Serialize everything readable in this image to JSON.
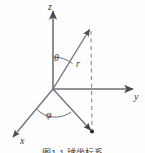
{
  "figure": {
    "caption": "图1-1  球坐标系",
    "background_color": "#fdfdfd",
    "stroke_color": "#6e6e78",
    "label_color": "#3a3a3a"
  },
  "axes": [
    {
      "id": "z",
      "label": "z",
      "direction": "up",
      "from": [
        53,
        89
      ],
      "to": [
        53,
        9
      ]
    },
    {
      "id": "y",
      "label": "y",
      "direction": "right",
      "from": [
        53,
        89
      ],
      "to": [
        136,
        89
      ]
    },
    {
      "id": "x",
      "label": "x",
      "direction": "down-left",
      "from": [
        53,
        89
      ],
      "to": [
        11,
        139
      ]
    }
  ],
  "vector": {
    "id": "r",
    "label": "r",
    "from": [
      53,
      89
    ],
    "to": [
      91,
      27
    ],
    "has_arrowhead": true
  },
  "projection": {
    "id": "xy-projection",
    "label": "",
    "from": [
      53,
      89
    ],
    "to": [
      92,
      132
    ],
    "has_arrowhead": true
  },
  "dashed_line": {
    "id": "vertical-dashed",
    "from": [
      91,
      29
    ],
    "to": [
      92,
      132
    ],
    "style": "dashed"
  },
  "angles": [
    {
      "id": "theta",
      "label": "θ",
      "between": [
        "z-axis",
        "r-vector"
      ],
      "vertex": [
        53,
        89
      ]
    },
    {
      "id": "phi",
      "label": "φ",
      "between": [
        "x-axis",
        "xy-projection"
      ],
      "vertex": [
        53,
        89
      ]
    }
  ],
  "point": {
    "id": "projected-point",
    "position": [
      92,
      132
    ]
  }
}
